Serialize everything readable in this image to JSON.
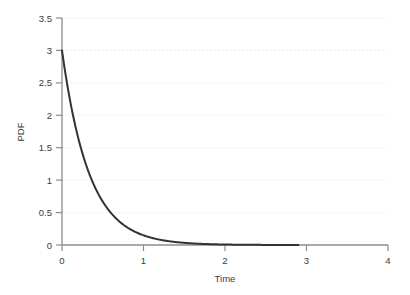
{
  "chart_data": {
    "type": "line",
    "title": "",
    "subtitle": "",
    "xlabel": "Time",
    "ylabel": "PDF",
    "xlim": [
      0,
      4
    ],
    "ylim": [
      0,
      3.5
    ],
    "xticks": [
      0,
      1,
      2,
      3,
      4
    ],
    "xtick_labels": [
      "0",
      "1",
      "2",
      "3",
      "4"
    ],
    "yticks": [
      0,
      0.5,
      1,
      1.5,
      2,
      2.5,
      3,
      3.5
    ],
    "ytick_labels": [
      "0",
      "0.5",
      "1",
      "1.5",
      "2",
      "2.5",
      "3",
      "3.5"
    ],
    "grid": true,
    "grid_axis": "y",
    "grid_style": "dotted",
    "legend": false,
    "legend_position": "none",
    "series": [
      {
        "name": "Exponential PDF (rate 3)",
        "formula": "3 * exp(-3 * t)",
        "color": "#333333",
        "line_width": 2,
        "x_start": 0,
        "x_end": 2.9,
        "x": [
          0,
          0.05,
          0.1,
          0.15,
          0.2,
          0.25,
          0.3,
          0.35,
          0.4,
          0.45,
          0.5,
          0.55,
          0.6,
          0.65,
          0.7,
          0.75,
          0.8,
          0.85,
          0.9,
          0.95,
          1.0,
          1.1,
          1.2,
          1.3,
          1.4,
          1.5,
          1.6,
          1.7,
          1.8,
          1.9,
          2.0,
          2.2,
          2.4,
          2.6,
          2.8,
          2.9
        ],
        "values": [
          3.0,
          2.582,
          2.222,
          1.913,
          1.646,
          1.417,
          1.22,
          1.05,
          0.904,
          0.778,
          0.669,
          0.576,
          0.496,
          0.427,
          0.367,
          0.316,
          0.272,
          0.234,
          0.202,
          0.174,
          0.149,
          0.111,
          0.082,
          0.061,
          0.045,
          0.033,
          0.025,
          0.018,
          0.014,
          0.01,
          0.007,
          0.004,
          0.002,
          0.001,
          0.001,
          0.0005
        ]
      }
    ]
  },
  "colors": {
    "curve": "#333333",
    "axis": "#8c8c8c",
    "tick_text": "#3b3b3b",
    "grid": "#f0ecef",
    "background": "#ffffff"
  },
  "axes": {
    "x_axis_label": "Time",
    "y_axis_label": "PDF"
  }
}
